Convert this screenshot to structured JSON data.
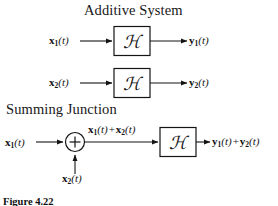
{
  "figure": {
    "caption": "Figure 4.22",
    "background_color": "#ffffff",
    "ink_color": "#141414"
  },
  "sections": [
    {
      "id": "additive",
      "title": "Additive System"
    },
    {
      "id": "summing",
      "title": "Summing Junction"
    }
  ],
  "additive_system": {
    "title": "Additive System",
    "rows": [
      {
        "input_label": {
          "var": "x",
          "sub": "1",
          "arg": "(t)",
          "text": "x1(t)"
        },
        "block_label": "ℋ",
        "block_name": "script-H",
        "output_label": {
          "var": "y",
          "sub": "1",
          "arg": "(t)",
          "text": "y1(t)"
        }
      },
      {
        "input_label": {
          "var": "x",
          "sub": "2",
          "arg": "(t)",
          "text": "x2(t)"
        },
        "block_label": "ℋ",
        "block_name": "script-H",
        "output_label": {
          "var": "y",
          "sub": "2",
          "arg": "(t)",
          "text": "y2(t)"
        }
      }
    ]
  },
  "summing_junction": {
    "title": "Summing Junction",
    "input_left": {
      "var": "x",
      "sub": "1",
      "arg": "(t)",
      "text": "x1(t)"
    },
    "input_bottom": {
      "var": "x",
      "sub": "2",
      "arg": "(t)",
      "text": "x2(t)"
    },
    "adder_symbol": "+",
    "sum_label": {
      "left": {
        "var": "x",
        "sub": "1",
        "arg": "(t)"
      },
      "op": "+",
      "right": {
        "var": "x",
        "sub": "2",
        "arg": "(t)"
      },
      "text": "x1(t) + x2(t)"
    },
    "block_label": "ℋ",
    "block_name": "script-H",
    "output_label": {
      "left": {
        "var": "y",
        "sub": "1",
        "arg": "(t)"
      },
      "op": "+",
      "right": {
        "var": "y",
        "sub": "2",
        "arg": "(t)"
      },
      "text": "y1(t) + y2(t)"
    }
  }
}
